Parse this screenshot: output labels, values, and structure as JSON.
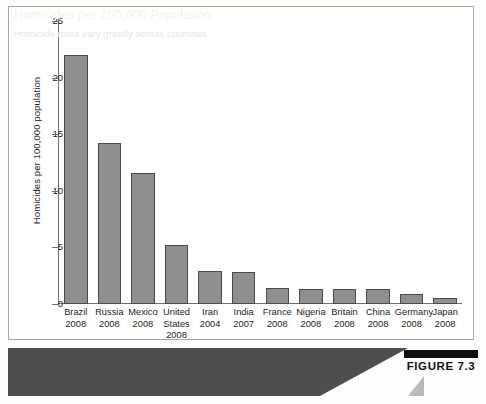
{
  "figure": {
    "badge_label": "FIGURE 7.3",
    "caption_title": "Homicides per 100,000 Population",
    "caption_subtitle": "Homicide rates vary greatly across countries."
  },
  "colors": {
    "bar_fill": "#8f8f8f",
    "bar_stroke": "#4a4a4a",
    "axis": "#6f6f6f",
    "caption_bar": "#4e4e4e",
    "badge_bar": "#111111",
    "plot_background": "#ffffff"
  },
  "chart_data": {
    "type": "bar",
    "title": "Homicides per 100,000 Population",
    "subtitle": "Homicide rates vary greatly across countries.",
    "xlabel": "",
    "ylabel": "Homicides per 100,000 population",
    "ylim": [
      0,
      25
    ],
    "ytick_values": [
      25,
      20,
      15,
      10,
      5,
      0
    ],
    "ytick_labels": [
      "25",
      "20",
      "15",
      "10",
      "5",
      "0"
    ],
    "grid": false,
    "legend": false,
    "categories": [
      "Brazil",
      "Russia",
      "Mexico",
      "United States",
      "Iran",
      "India",
      "France",
      "Nigeria",
      "Britain",
      "China",
      "Germany",
      "Japan"
    ],
    "category_lines": [
      [
        "Brazil",
        "2008"
      ],
      [
        "Russia",
        "2008"
      ],
      [
        "Mexico",
        "2008"
      ],
      [
        "United",
        "States",
        "2008"
      ],
      [
        "Iran",
        "2004"
      ],
      [
        "India",
        "2007"
      ],
      [
        "France",
        "2008"
      ],
      [
        "Nigeria",
        "2008"
      ],
      [
        "Britain",
        "2008"
      ],
      [
        "China",
        "2008"
      ],
      [
        "Germany",
        "2008"
      ],
      [
        "Japan",
        "2008"
      ]
    ],
    "years": [
      "2008",
      "2008",
      "2008",
      "2008",
      "2004",
      "2007",
      "2008",
      "2008",
      "2008",
      "2008",
      "2008",
      "2008"
    ],
    "values": [
      22.0,
      14.2,
      11.6,
      5.2,
      2.9,
      2.8,
      1.4,
      1.3,
      1.3,
      1.3,
      0.9,
      0.5
    ]
  }
}
